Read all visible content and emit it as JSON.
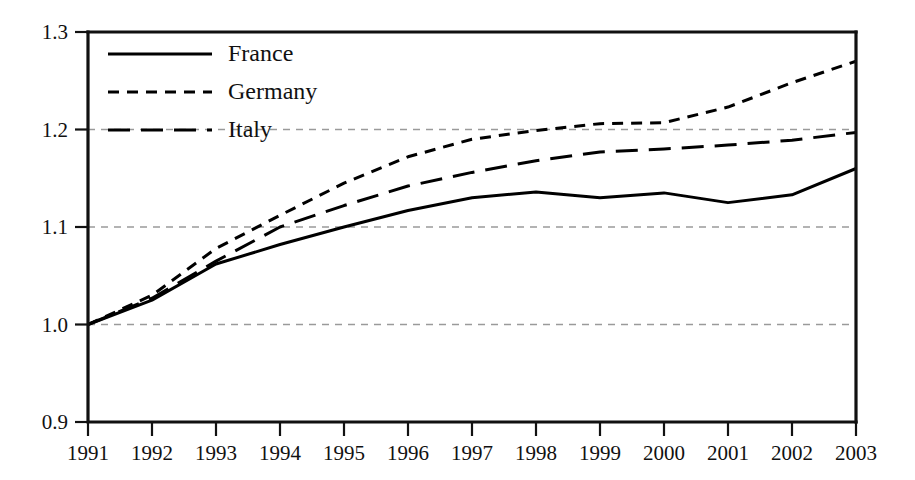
{
  "chart_data": {
    "type": "line",
    "title": "",
    "subtitle": "",
    "xlabel": "",
    "ylabel": "",
    "x": [
      1991,
      1992,
      1993,
      1994,
      1995,
      1996,
      1997,
      1998,
      1999,
      2000,
      2001,
      2002,
      2003
    ],
    "categories": [
      "1991",
      "1992",
      "1993",
      "1994",
      "1995",
      "1996",
      "1997",
      "1998",
      "1999",
      "2000",
      "2001",
      "2002",
      "2003"
    ],
    "xlim": [
      1991,
      2003
    ],
    "ylim": [
      0.9,
      1.3
    ],
    "yticks": [
      0.9,
      1.0,
      1.1,
      1.2,
      1.3
    ],
    "ytick_labels": [
      "0.9",
      "1.0",
      "1.1",
      "1.2",
      "1.3"
    ],
    "xticks": [
      1991,
      1992,
      1993,
      1994,
      1995,
      1996,
      1997,
      1998,
      1999,
      2000,
      2001,
      2002,
      2003
    ],
    "grid": true,
    "grid_axis": "y",
    "legend_position": "top-left",
    "series": [
      {
        "name": "France",
        "style": "solid",
        "color": "#000000",
        "values": [
          1.0,
          1.025,
          1.062,
          1.082,
          1.1,
          1.117,
          1.13,
          1.136,
          1.13,
          1.135,
          1.125,
          1.133,
          1.16
        ]
      },
      {
        "name": "Germany",
        "style": "short-dash",
        "color": "#000000",
        "values": [
          1.0,
          1.03,
          1.078,
          1.112,
          1.145,
          1.172,
          1.19,
          1.199,
          1.206,
          1.207,
          1.223,
          1.248,
          1.27
        ]
      },
      {
        "name": "Italy",
        "style": "long-dash",
        "color": "#000000",
        "values": [
          1.0,
          1.027,
          1.065,
          1.1,
          1.122,
          1.142,
          1.156,
          1.168,
          1.177,
          1.18,
          1.184,
          1.189,
          1.197
        ]
      }
    ]
  },
  "legend": {
    "entries": [
      {
        "label": "France"
      },
      {
        "label": "Germany"
      },
      {
        "label": "Italy"
      }
    ]
  },
  "axes": {
    "y_labels": [
      "1.3",
      "1.2",
      "1.1",
      "1.0",
      "0.9"
    ],
    "x_labels": [
      "1991",
      "1992",
      "1993",
      "1994",
      "1995",
      "1996",
      "1997",
      "1998",
      "1999",
      "2000",
      "2001",
      "2002",
      "2003"
    ]
  },
  "colors": {
    "line": "#000000",
    "grid": "#9a9a9a",
    "axis": "#111111",
    "background": "#ffffff"
  }
}
